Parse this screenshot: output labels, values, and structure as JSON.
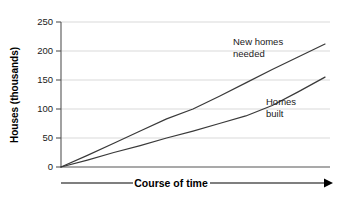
{
  "chart_data": {
    "type": "line",
    "title": "",
    "xlabel": "Course of time",
    "ylabel": "Houses (thousands)",
    "ylim": [
      0,
      250
    ],
    "xlim": [
      0,
      100
    ],
    "yticks": [
      0,
      50,
      100,
      150,
      200,
      250
    ],
    "ytick_labels": [
      "0",
      "50",
      "100",
      "150",
      "200",
      "250"
    ],
    "xticks": [],
    "xtick_labels": [],
    "grid": "horizontal",
    "legend_position": "inline-annotations",
    "x_axis_style": "arrow",
    "series": [
      {
        "name": "New homes needed",
        "annotation_lines": [
          "New homes",
          "needed"
        ],
        "color": "#3a3a3a",
        "x": [
          0,
          10,
          20,
          30,
          40,
          50,
          60,
          70,
          80,
          90,
          100
        ],
        "values": [
          0,
          20,
          41,
          62,
          83,
          100,
          122,
          145,
          168,
          190,
          212
        ]
      },
      {
        "name": "Homes built",
        "annotation_lines": [
          "Homes",
          "built"
        ],
        "color": "#3a3a3a",
        "x": [
          0,
          10,
          20,
          30,
          40,
          50,
          60,
          70,
          80,
          90,
          100
        ],
        "values": [
          0,
          12,
          25,
          37,
          50,
          62,
          75,
          88,
          106,
          130,
          155
        ]
      }
    ]
  },
  "axes": {
    "y_title": "Houses (thousands)",
    "x_title": "Course of time"
  },
  "ticks": {
    "y": [
      "250",
      "200",
      "150",
      "100",
      "50",
      "0"
    ]
  },
  "annotations": {
    "new_homes_line1": "New homes",
    "new_homes_line2": "needed",
    "homes_built_line1": "Homes",
    "homes_built_line2": "built"
  },
  "colors": {
    "series_stroke": "#3a3a3a",
    "gridline": "#c8c8c8",
    "axis": "#555555",
    "text": "#1a1a1a",
    "background": "#ffffff"
  }
}
